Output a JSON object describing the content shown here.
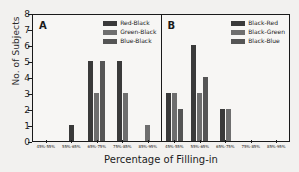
{
  "chart_data": {
    "type": "bar",
    "title": "",
    "xlabel": "Percentage of Filling-in",
    "ylabel": "No. of Subjects",
    "ylim": [
      0,
      8
    ],
    "yticks": [
      0,
      1,
      2,
      3,
      4,
      5,
      6,
      7,
      8
    ],
    "grid": false,
    "legend_position": "top-right",
    "categories": [
      "45%-55%",
      "55%-65%",
      "65%-75%",
      "75%-85%",
      "85%-95%"
    ],
    "panels": [
      {
        "label": "A",
        "series": [
          {
            "name": "Red-Black",
            "color": "#3a3a3a",
            "values": [
              0,
              1,
              5,
              5,
              0
            ]
          },
          {
            "name": "Green-Black",
            "color": "#6e6e6e",
            "values": [
              0,
              0,
              3,
              3,
              1
            ]
          },
          {
            "name": "Blue-Black",
            "color": "#555555",
            "values": [
              0,
              0,
              5,
              0,
              0
            ]
          }
        ]
      },
      {
        "label": "B",
        "series": [
          {
            "name": "Black-Red",
            "color": "#3a3a3a",
            "values": [
              3,
              6,
              2,
              0,
              0
            ]
          },
          {
            "name": "Black-Green",
            "color": "#6e6e6e",
            "values": [
              3,
              3,
              2,
              0,
              0
            ]
          },
          {
            "name": "Black-Blue",
            "color": "#555555",
            "values": [
              2,
              4,
              0,
              0,
              0
            ]
          }
        ]
      }
    ]
  },
  "axis": {
    "ylabel": "No. of Subjects",
    "xlabel": "Percentage of Filling-in"
  }
}
